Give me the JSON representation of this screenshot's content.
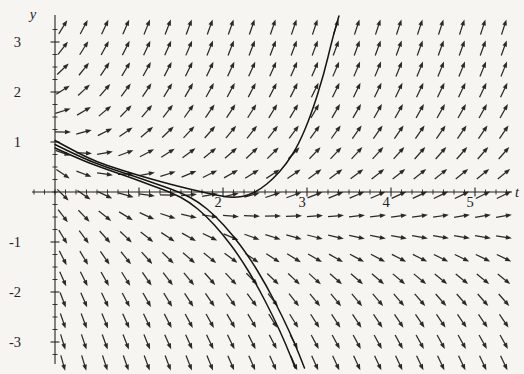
{
  "chart_data": {
    "type": "scatter",
    "subtype": "direction-field-with-solution-curves",
    "title": "",
    "xlabel": "t",
    "ylabel": "y",
    "x_range": [
      -0.27,
      5.45
    ],
    "y_range": [
      -3.45,
      3.55
    ],
    "x_tick_labels": [
      2,
      3,
      4,
      5
    ],
    "y_tick_labels": [
      3,
      2,
      1,
      -1,
      -2,
      -3
    ],
    "x_minor_step": 0.125,
    "y_minor_step": 0.25,
    "grid": "off",
    "legend": "none",
    "layout_px": {
      "width": 524,
      "height": 374,
      "origin": [
        55,
        192
      ],
      "px_per_unit_x": 84,
      "px_per_unit_y": 50,
      "x_axis_span_px": [
        32,
        512
      ],
      "y_axis_span_px": [
        15,
        364
      ]
    },
    "field": {
      "rule": "dy/dt = k*(y - (a*exp(-b*t) - c))",
      "k": 1.3,
      "a": 2.1,
      "b": 0.85,
      "c": 0.72,
      "grid_t_start": 0.095,
      "grid_t_step": 0.25,
      "cols": 22,
      "grid_y_start": 3.3,
      "grid_y_step": -0.42,
      "rows": 17,
      "arrow_length_px": 16
    },
    "solution_curves": [
      {
        "name": "upper-branch",
        "points": [
          [
            0,
            1.03
          ],
          [
            0.25,
            0.8
          ],
          [
            0.5,
            0.6
          ],
          [
            0.75,
            0.46
          ],
          [
            1.0,
            0.33
          ],
          [
            1.25,
            0.21
          ],
          [
            1.5,
            0.1
          ],
          [
            1.75,
            0.0
          ],
          [
            2.0,
            -0.09
          ],
          [
            2.15,
            -0.11
          ],
          [
            2.3,
            -0.07
          ],
          [
            2.45,
            0.06
          ],
          [
            2.6,
            0.27
          ],
          [
            2.75,
            0.55
          ],
          [
            2.9,
            0.95
          ],
          [
            3.05,
            1.55
          ],
          [
            3.2,
            2.35
          ],
          [
            3.3,
            3.05
          ],
          [
            3.38,
            3.52
          ]
        ]
      },
      {
        "name": "middle-branch",
        "points": [
          [
            0,
            0.95
          ],
          [
            0.3,
            0.7
          ],
          [
            0.6,
            0.5
          ],
          [
            0.9,
            0.34
          ],
          [
            1.26,
            0.13
          ],
          [
            1.51,
            -0.02
          ],
          [
            1.71,
            -0.2
          ],
          [
            1.91,
            -0.48
          ],
          [
            2.11,
            -0.85
          ],
          [
            2.31,
            -1.3
          ],
          [
            2.51,
            -1.85
          ],
          [
            2.71,
            -2.5
          ],
          [
            2.86,
            -3.05
          ],
          [
            2.97,
            -3.52
          ]
        ]
      },
      {
        "name": "lower-branch",
        "points": [
          [
            0,
            0.88
          ],
          [
            0.3,
            0.65
          ],
          [
            0.6,
            0.46
          ],
          [
            0.9,
            0.29
          ],
          [
            1.15,
            0.13
          ],
          [
            1.4,
            -0.02
          ],
          [
            1.6,
            -0.2
          ],
          [
            1.8,
            -0.48
          ],
          [
            2.0,
            -0.85
          ],
          [
            2.2,
            -1.3
          ],
          [
            2.4,
            -1.85
          ],
          [
            2.6,
            -2.5
          ],
          [
            2.75,
            -3.05
          ],
          [
            2.86,
            -3.52
          ]
        ]
      }
    ],
    "colors": {
      "background": "#f6f5f1",
      "axis": "#26231f",
      "arrow": "#2d2a26",
      "curve": "#171512",
      "text": "#26231f"
    },
    "font_px": {
      "tick": 14.5,
      "axis_letter": 14.5
    }
  }
}
